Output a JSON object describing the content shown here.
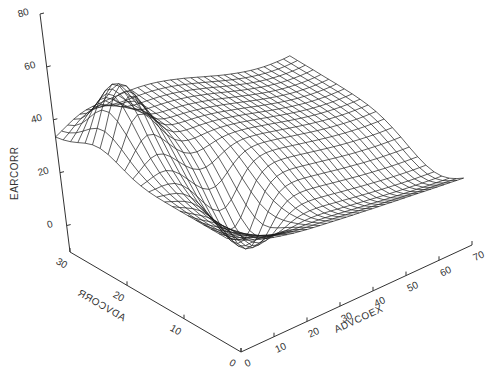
{
  "chart_data": {
    "type": "surface",
    "title": "",
    "style": "wireframe",
    "xlabel": "ADVCOEX",
    "ylabel": "ADVCORR",
    "zlabel": "EARCORR",
    "xlim": [
      0,
      70
    ],
    "ylim": [
      0,
      30
    ],
    "zlim": [
      -10,
      80
    ],
    "x_ticks": [
      "0",
      "10",
      "20",
      "30",
      "40",
      "50",
      "60",
      "70"
    ],
    "y_ticks": [
      "0",
      "10",
      "20",
      "30"
    ],
    "z_ticks": [
      "0",
      "20",
      "40",
      "60",
      "80"
    ],
    "grid": false,
    "legend": null,
    "surface_samples": [
      {
        "x": 0,
        "y": 30,
        "z": 33
      },
      {
        "x": 8,
        "y": 22,
        "z": 55
      },
      {
        "x": 20,
        "y": 12,
        "z": 6
      },
      {
        "x": 40,
        "y": 20,
        "z": 30
      },
      {
        "x": 70,
        "y": 30,
        "z": 28
      },
      {
        "x": 70,
        "y": 5,
        "z": 12
      }
    ],
    "line_color": "#1a1a1a",
    "axis_color": "#333333"
  }
}
